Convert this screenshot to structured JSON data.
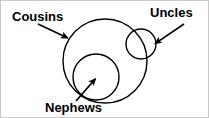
{
  "figure": {
    "type": "venn-diagram",
    "title": "",
    "background_color": "#ffffff",
    "stroke_color": "#000000",
    "border_color": "#c8c8c8",
    "width": 209,
    "height": 118
  },
  "sets": [
    {
      "id": "cousins",
      "label": "Cousins",
      "shape": "circle",
      "center_x": 104,
      "center_y": 60,
      "radius": 42,
      "relation": "outer set; fully contains Nephews, partially overlaps Uncles"
    },
    {
      "id": "uncles",
      "label": "Uncles",
      "shape": "circle",
      "center_x": 140,
      "center_y": 43,
      "radius": 15,
      "relation": "partially overlaps Cousins"
    },
    {
      "id": "nephews",
      "label": "Nephews",
      "shape": "circle",
      "center_x": 95,
      "center_y": 76,
      "radius": 23,
      "relation": "fully inside Cousins"
    }
  ],
  "annotations": [
    {
      "id": "cousins-arrow",
      "target": "cousins",
      "from_x": 37,
      "from_y": 23,
      "to_x": 69,
      "to_y": 38,
      "direction": "down-right"
    },
    {
      "id": "uncles-arrow",
      "target": "uncles",
      "from_x": 183,
      "from_y": 23,
      "to_x": 152,
      "to_y": 44,
      "direction": "down-left"
    },
    {
      "id": "nephews-arrow",
      "target": "nephews",
      "from_x": 75,
      "from_y": 100,
      "to_x": 96,
      "to_y": 76,
      "direction": "up-right"
    }
  ]
}
